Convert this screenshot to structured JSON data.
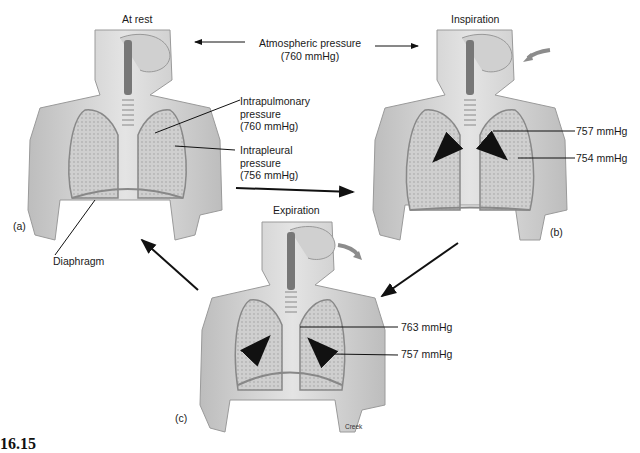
{
  "panels": {
    "a": {
      "title": "At rest",
      "letter": "(a)",
      "labels": {
        "intrapulmonary": [
          "Intrapulmonary",
          "pressure",
          "(760 mmHg)"
        ],
        "intrapleural": [
          "Intrapleural",
          "pressure",
          "(756 mmHg)"
        ],
        "diaphragm": "Diaphragm"
      }
    },
    "b": {
      "title": "Inspiration",
      "letter": "(b)",
      "labels": {
        "intrapulmonary": "757 mmHg",
        "intrapleural": "754 mmHg"
      }
    },
    "c": {
      "title": "Expiration",
      "letter": "(c)",
      "labels": {
        "intrapulmonary": "763 mmHg",
        "intrapleural": "757 mmHg"
      },
      "credit": "Creek"
    }
  },
  "atmospheric": {
    "line1": "Atmospheric pressure",
    "line2": "(760 mmHg)"
  },
  "figure_number": "16.15",
  "colors": {
    "body_fill": "#d9d9d9",
    "body_stroke": "#9a9a9a",
    "lung_fill": "#c8c8c8",
    "arrow": "#111111",
    "air_arrow": "#8c8c8c"
  }
}
